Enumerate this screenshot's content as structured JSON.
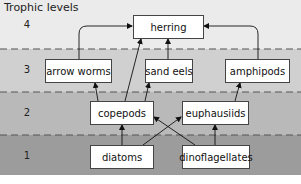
{
  "title": "Trophic levels",
  "levels": [
    {
      "number": "4"
    },
    {
      "number": "3"
    },
    {
      "number": "2"
    },
    {
      "number": "1"
    }
  ],
  "nodes": {
    "herring": {
      "label": "herring",
      "level": 4
    },
    "arrow_worms": {
      "label": "arrow worms",
      "level": 3
    },
    "sand_eels": {
      "label": "sand eels",
      "level": 3
    },
    "amphipods": {
      "label": "amphipods",
      "level": 3
    },
    "copepods": {
      "label": "copepods",
      "level": 2
    },
    "euphausiids": {
      "label": "euphausiids",
      "level": 2
    },
    "diatoms": {
      "label": "diatoms",
      "level": 1
    },
    "dinoflagellates": {
      "label": "dinoflagellates",
      "level": 1
    }
  },
  "edges": [
    {
      "from": "arrow worms",
      "to": "herring"
    },
    {
      "from": "sand eels",
      "to": "herring"
    },
    {
      "from": "amphipods",
      "to": "herring"
    },
    {
      "from": "copepods",
      "to": "herring"
    },
    {
      "from": "copepods",
      "to": "arrow worms"
    },
    {
      "from": "copepods",
      "to": "sand eels"
    },
    {
      "from": "euphausiids",
      "to": "amphipods"
    },
    {
      "from": "diatoms",
      "to": "copepods"
    },
    {
      "from": "diatoms",
      "to": "euphausiids"
    },
    {
      "from": "dinoflagellates",
      "to": "copepods"
    },
    {
      "from": "dinoflagellates",
      "to": "euphausiids"
    }
  ],
  "colors": {
    "level4": "#ebebeb",
    "level3": "#d0d0d0",
    "level2": "#b9b9b9",
    "level1": "#9c9c9c",
    "divider": "#555555"
  }
}
